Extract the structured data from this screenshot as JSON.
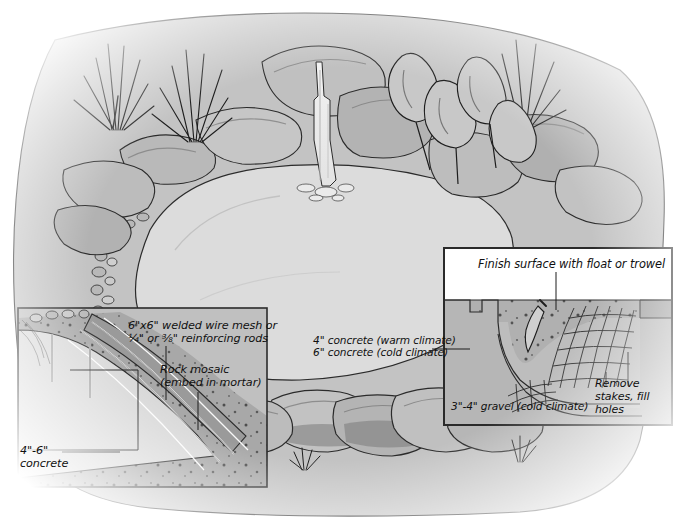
{
  "illustration": {
    "title": "Concrete garden pond construction cutaway",
    "subject": "pond-construction-diagram",
    "palette": {
      "ink": "#101010",
      "water": "#dcdcdc",
      "ground": "#c3c3c3",
      "soil": "#a8a8a8",
      "rock_light": "#c9c9c9",
      "rock_mid": "#a9a9a9",
      "rock_dark": "#8e8e8e",
      "panel_bg": "#ffffff",
      "panel_border": "#2a2a2a"
    }
  },
  "cutaway_left": {
    "name": "left-cutaway-panel",
    "labels": {
      "mesh": "6\"x6\" welded wire mesh or\n¼\" or ⅜\" reinforcing rods",
      "mosaic": "Rock mosaic\n(embed in mortar)",
      "concrete_line1": "4\"-6\"",
      "concrete_line2": "concrete"
    }
  },
  "center_callout": {
    "name": "concrete-thickness-callout",
    "warm": "4\" concrete (warm climate)",
    "cold": "6\" concrete (cold climate)"
  },
  "inset_right": {
    "name": "detail-inset-panel",
    "labels": {
      "finish": "Finish surface with float or trowel",
      "gravel": "3\"-4\" gravel (cold climate)",
      "remove": "Remove\nstakes, fill\nholes"
    }
  },
  "scene_elements": {
    "waterfall": "waterfall",
    "plants": [
      "grass-tuft",
      "grass-tuft",
      "grass-tuft",
      "leafy-plant"
    ],
    "pond": "pond-water-surface",
    "rock_border": "rock-mosaic-border"
  }
}
